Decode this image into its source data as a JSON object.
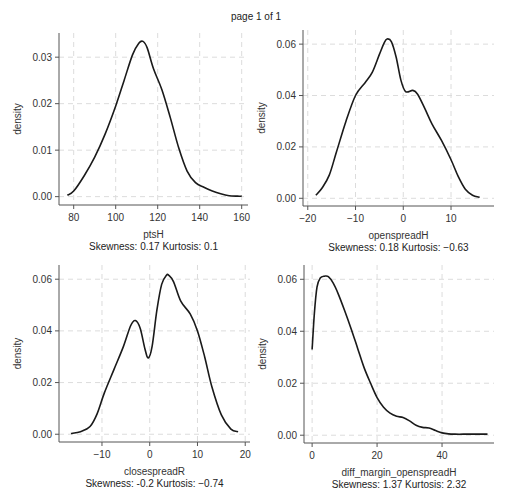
{
  "page": {
    "title": "page 1 of 1"
  },
  "colors": {
    "curve": "#1a1a1a",
    "grid": "#dcdcdc",
    "axis": "#555555"
  },
  "chart_data": [
    {
      "type": "line",
      "title": "",
      "xlabel": "ptsH",
      "caption": "Skewness: 0.17 Kurtosis: 0.1",
      "ylabel": "density",
      "xlim": [
        73,
        163
      ],
      "ylim": [
        -0.0018,
        0.0352
      ],
      "xticks": [
        80,
        100,
        120,
        140,
        160
      ],
      "xtick_labels": [
        "80",
        "100",
        "120",
        "140",
        "160"
      ],
      "yticks": [
        0,
        0.01,
        0.02,
        0.03
      ],
      "ytick_labels": [
        "0.00",
        "0.01",
        "0.02",
        "0.03"
      ],
      "grid": true,
      "series": [
        {
          "name": "density",
          "x": [
            77,
            80,
            85,
            90,
            95,
            100,
            104,
            108,
            111,
            113,
            115,
            118,
            122,
            126,
            130,
            134,
            138,
            142,
            146,
            150,
            154,
            158,
            160
          ],
          "y": [
            0.0003,
            0.0012,
            0.0045,
            0.0085,
            0.0135,
            0.0195,
            0.025,
            0.0305,
            0.033,
            0.0334,
            0.032,
            0.0275,
            0.023,
            0.017,
            0.0105,
            0.0055,
            0.003,
            0.002,
            0.0012,
            0.0006,
            0.0002,
            0.0001,
            0.0001
          ]
        }
      ]
    },
    {
      "type": "line",
      "title": "",
      "xlabel": "openspreadH",
      "caption": "Skewness: 0.18 Kurtosis: −0.63",
      "ylabel": "density",
      "xlim": [
        -21,
        19
      ],
      "ylim": [
        -0.003,
        0.0655
      ],
      "xticks": [
        -20,
        -10,
        0,
        10
      ],
      "xtick_labels": [
        "−20",
        "−10",
        "0",
        "10"
      ],
      "yticks": [
        0,
        0.02,
        0.04,
        0.06
      ],
      "ytick_labels": [
        "0.00",
        "0.02",
        "0.04",
        "0.06"
      ],
      "grid": true,
      "series": [
        {
          "name": "density",
          "x": [
            -18.3,
            -17,
            -15.5,
            -14,
            -12,
            -10,
            -8,
            -6.5,
            -5,
            -4,
            -3.4,
            -2.5,
            -1.5,
            -0.5,
            0.5,
            2,
            3,
            4.5,
            6,
            8,
            10,
            11.5,
            13,
            14.5,
            16
          ],
          "y": [
            0.0012,
            0.004,
            0.009,
            0.018,
            0.03,
            0.04,
            0.045,
            0.049,
            0.056,
            0.0605,
            0.062,
            0.061,
            0.055,
            0.046,
            0.0415,
            0.042,
            0.0405,
            0.035,
            0.029,
            0.0225,
            0.015,
            0.0085,
            0.0035,
            0.0012,
            0.0004
          ]
        }
      ]
    },
    {
      "type": "line",
      "title": "",
      "xlabel": "closespreadR",
      "caption": "Skewness: -0.2 Kurtosis: −0.74",
      "ylabel": "density",
      "xlim": [
        -19,
        21
      ],
      "ylim": [
        -0.003,
        0.0655
      ],
      "xticks": [
        -10,
        0,
        10,
        20
      ],
      "xtick_labels": [
        "−10",
        "0",
        "10",
        "20"
      ],
      "yticks": [
        0,
        0.02,
        0.04,
        0.06
      ],
      "ytick_labels": [
        "0.00",
        "0.02",
        "0.04",
        "0.06"
      ],
      "grid": true,
      "series": [
        {
          "name": "density",
          "x": [
            -16.5,
            -14.5,
            -12.5,
            -11,
            -9.5,
            -7.5,
            -5.5,
            -4,
            -3,
            -2,
            -1,
            -0.3,
            0.5,
            1.5,
            2.5,
            3.5,
            4,
            5,
            6.5,
            8.5,
            10,
            11.5,
            13,
            15,
            17,
            18.5
          ],
          "y": [
            0.0003,
            0.001,
            0.003,
            0.008,
            0.016,
            0.025,
            0.034,
            0.042,
            0.044,
            0.041,
            0.033,
            0.0295,
            0.034,
            0.048,
            0.058,
            0.0615,
            0.0615,
            0.059,
            0.0515,
            0.0465,
            0.04,
            0.03,
            0.0185,
            0.0075,
            0.002,
            0.001
          ]
        }
      ]
    },
    {
      "type": "line",
      "title": "",
      "xlabel": "diff_margin_openspreadH",
      "caption": "Skewness: 1.37 Kurtosis: 2.32",
      "ylabel": "density",
      "xlim": [
        -2.5,
        56
      ],
      "ylim": [
        -0.003,
        0.0655
      ],
      "xticks": [
        0,
        20,
        40
      ],
      "xtick_labels": [
        "0",
        "20",
        "40"
      ],
      "yticks": [
        0,
        0.02,
        0.04,
        0.06
      ],
      "ytick_labels": [
        "0.00",
        "0.02",
        "0.04",
        "0.06"
      ],
      "grid": true,
      "series": [
        {
          "name": "density",
          "x": [
            0,
            0.7,
            1.5,
            2.5,
            3.8,
            5,
            6.5,
            8,
            10,
            12,
            14,
            16,
            18,
            20,
            22,
            24,
            26,
            28,
            30,
            32,
            34,
            36,
            38,
            40,
            42,
            44,
            48,
            52,
            54
          ],
          "y": [
            0.033,
            0.047,
            0.057,
            0.0605,
            0.0612,
            0.061,
            0.0585,
            0.0545,
            0.048,
            0.041,
            0.0335,
            0.026,
            0.02,
            0.0145,
            0.0108,
            0.0085,
            0.0073,
            0.0068,
            0.0055,
            0.0038,
            0.003,
            0.0028,
            0.0018,
            0.0009,
            0.0005,
            0.0004,
            0.0004,
            0.0004,
            0.0004
          ]
        }
      ]
    }
  ]
}
